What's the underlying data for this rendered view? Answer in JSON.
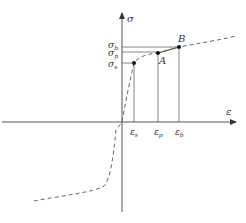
{
  "diagram": {
    "type": "stress-strain curve",
    "axes": {
      "y_label": "σ",
      "x_label": "ε"
    },
    "y_ticks": {
      "sigma_b": {
        "main": "σ",
        "sub": "b"
      },
      "sigma_p": {
        "main": "σ",
        "sub": "p"
      },
      "sigma_s": {
        "main": "σ",
        "sub": "s"
      }
    },
    "x_ticks": {
      "eps_s": {
        "main": "ε",
        "sub": "s"
      },
      "eps_p": {
        "main": "ε",
        "sub": "p"
      },
      "eps_b": {
        "main": "ε",
        "sub": "b"
      }
    },
    "points": {
      "A": "A",
      "B": "B"
    },
    "colors": {
      "axis": "#555555",
      "curve": "#666666",
      "point": "#111111",
      "guide": "#666666"
    }
  }
}
